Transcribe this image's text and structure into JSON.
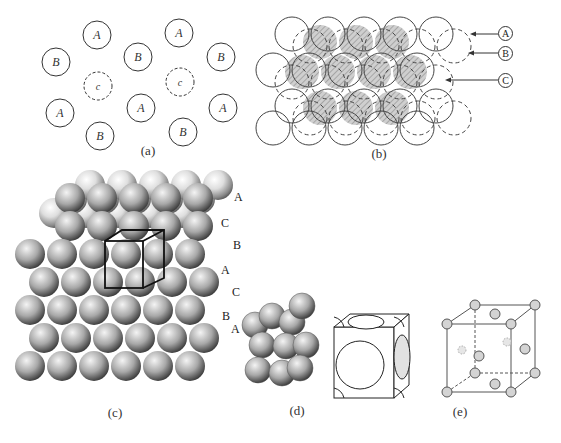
{
  "figure": {
    "panels": {
      "a": {
        "caption": "(a)",
        "description": "Close-packed layer positions A, B and C",
        "sites": [
          {
            "label": "A",
            "x": 97,
            "y": 35,
            "style": "solid"
          },
          {
            "label": "A",
            "x": 179,
            "y": 33,
            "style": "solid"
          },
          {
            "label": "B",
            "x": 56,
            "y": 62,
            "style": "solid"
          },
          {
            "label": "B",
            "x": 138,
            "y": 57,
            "style": "solid"
          },
          {
            "label": "B",
            "x": 221,
            "y": 57,
            "style": "solid"
          },
          {
            "label": "c",
            "x": 98,
            "y": 86,
            "style": "dashed"
          },
          {
            "label": "c",
            "x": 180,
            "y": 82,
            "style": "dashed"
          },
          {
            "label": "A",
            "x": 60,
            "y": 113,
            "style": "solid"
          },
          {
            "label": "A",
            "x": 141,
            "y": 108,
            "style": "solid"
          },
          {
            "label": "A",
            "x": 223,
            "y": 108,
            "style": "solid"
          },
          {
            "label": "B",
            "x": 100,
            "y": 136,
            "style": "solid"
          },
          {
            "label": "B",
            "x": 183,
            "y": 132,
            "style": "solid"
          }
        ]
      },
      "b": {
        "caption": "(b)",
        "description": "Stacked layers A (solid), B (dashed), C (hatched)",
        "layer_labels": [
          "A",
          "B",
          "C"
        ]
      },
      "c": {
        "caption": "(c)",
        "description": "Cubic close-packed sphere stack with unit cell outlined",
        "stacking_labels": [
          "A",
          "C",
          "B",
          "A",
          "C",
          "B",
          "A"
        ]
      },
      "d": {
        "caption": "(d)",
        "description": "Face-centered cubic unit cell: spheres and cut-sphere model"
      },
      "e": {
        "caption": "(e)",
        "description": "FCC lattice points in cubic unit cell"
      }
    },
    "colors": {
      "line": "#333333",
      "hatch_fill": "#c8c8c8",
      "sphere_light": "#f2f2f2",
      "sphere_dark": "#6e6e6e",
      "node_fill": "#d4d4d4"
    }
  }
}
